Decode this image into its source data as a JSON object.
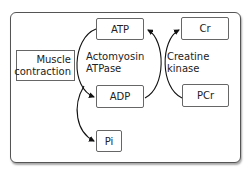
{
  "diagram": {
    "nodes": {
      "muscle_contraction": "Muscle\ncontraction",
      "atp": "ATP",
      "adp": "ADP",
      "pi": "Pi",
      "cr": "Cr",
      "pcr": "PCr"
    },
    "labels": {
      "actomyosin_line1": "Actomyosin",
      "actomyosin_line2": "ATPase",
      "creatine_line1": "Creatine",
      "creatine_line2": "kinase"
    },
    "edges": [
      {
        "from": "ATP",
        "to": "ADP",
        "enzyme": "Actomyosin ATPase"
      },
      {
        "from": "ATP",
        "to": "Pi",
        "enzyme": "Actomyosin ATPase"
      },
      {
        "from": "ADP",
        "to": "ATP",
        "enzyme": "Creatine kinase"
      },
      {
        "from": "PCr",
        "to": "Cr",
        "enzyme": "Creatine kinase"
      }
    ]
  }
}
